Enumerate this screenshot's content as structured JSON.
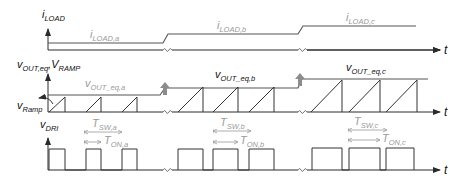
{
  "diagram": {
    "colors": {
      "waveform": "#333333",
      "annotation": "#9a9a9a",
      "step_arrow": "#8c8c8c"
    },
    "panels": {
      "iload": {
        "axis_var": "i",
        "axis_sub": "LOAD",
        "levels": [
          {
            "var": "i",
            "sub": "LOAD,a"
          },
          {
            "var": "i",
            "sub": "LOAD,b"
          },
          {
            "var": "i",
            "sub": "LOAD,c"
          }
        ],
        "time_label": "t"
      },
      "vout": {
        "axis_var1": "v",
        "axis_sub1": "OUT,eq",
        "axis_sep": ",",
        "axis_var2": "V",
        "axis_sub2": "RAMP",
        "ramp_var": "v",
        "ramp_sub": "Ramp",
        "levels": [
          {
            "var": "v",
            "sub": "OUT_eq,a"
          },
          {
            "var": "v",
            "sub": "OUT_eq,b"
          },
          {
            "var": "v",
            "sub": "OUT_eq,c"
          }
        ],
        "time_label": "t"
      },
      "vdri": {
        "axis_var": "v",
        "axis_sub": "DRI",
        "periods": [
          {
            "tsw_var": "T",
            "tsw_sub": "SW,a",
            "ton_var": "T",
            "ton_sub": "ON,a"
          },
          {
            "tsw_var": "T",
            "tsw_sub": "SW,b",
            "ton_var": "T",
            "ton_sub": "ON,b"
          },
          {
            "tsw_var": "T",
            "tsw_sub": "SW,c",
            "ton_var": "T",
            "ton_sub": "ON,c"
          }
        ],
        "time_label": "t"
      }
    },
    "segments": [
      {
        "name": "a",
        "load_level": "low",
        "duty": "short"
      },
      {
        "name": "b",
        "load_level": "medium",
        "duty": "medium"
      },
      {
        "name": "c",
        "load_level": "high",
        "duty": "long"
      }
    ]
  }
}
